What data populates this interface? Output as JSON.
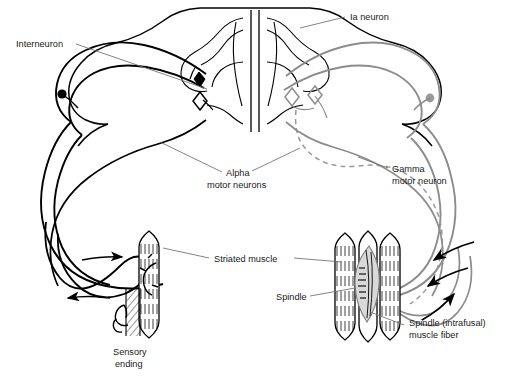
{
  "figure": {
    "type": "anatomical-diagram",
    "background_color": "#ffffff",
    "line_color_left": "#000000",
    "line_color_right": "#8c8c8c",
    "leader_color": "#6e6e6e",
    "spindle_fill": "#d9d9d9"
  },
  "labels": {
    "interneuron": "Interneuron",
    "ia_neuron": "Ia neuron",
    "alpha_line1": "Alpha",
    "alpha_line2": "motor neurons",
    "gamma_line1": "Gamma",
    "gamma_line2": "motor neuron",
    "striated_muscle": "Striated muscle",
    "spindle": "Spindle",
    "spindle_intrafusal_line1": "Spindle (intrafusal)",
    "spindle_intrafusal_line2": "muscle fiber",
    "sensory_line1": "Sensory",
    "sensory_line2": "ending"
  }
}
